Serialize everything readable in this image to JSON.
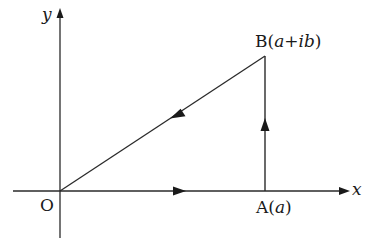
{
  "diagram": {
    "axes": {
      "x_label": "x",
      "y_label": "y"
    },
    "points": {
      "origin": {
        "label": "O"
      },
      "A": {
        "name": "A",
        "open": "(",
        "value": "a",
        "close": ")"
      },
      "B": {
        "name": "B",
        "open": "(",
        "value": "a+ib",
        "close": ")"
      }
    },
    "path": [
      "O",
      "A",
      "B",
      "O"
    ],
    "stroke_color": "#2a2a2a"
  }
}
